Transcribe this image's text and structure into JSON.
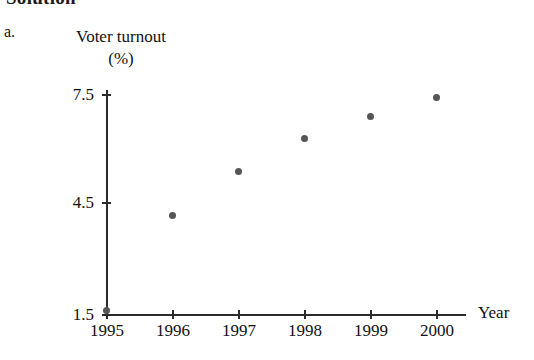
{
  "heading": {
    "text": "Solution"
  },
  "part": {
    "label": "a."
  },
  "chart_data": {
    "type": "scatter",
    "title": "Voter turnout",
    "ylabel": "Voter turnout",
    "yunit": "(%)",
    "xlabel": "Year",
    "categories": [
      "1995",
      "1996",
      "1997",
      "1998",
      "1999",
      "2000"
    ],
    "x": [
      1995,
      1996,
      1997,
      1998,
      1999,
      2000
    ],
    "values": [
      1.6,
      4.2,
      5.4,
      6.3,
      6.9,
      7.4
    ],
    "ylim": [
      1.5,
      7.5
    ],
    "yticks": [
      "7.5",
      "4.5",
      "1.5"
    ],
    "ytick_values": [
      7.5,
      4.5,
      1.5
    ],
    "xlim": [
      1995,
      2000
    ],
    "grid": false,
    "legend": null,
    "marker_color": "#555555",
    "axis_color": "#2b2b2b"
  }
}
